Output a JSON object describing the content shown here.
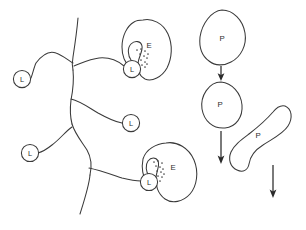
{
  "figure": {
    "background_color": "#ffffff",
    "line_color": "#3a3a3a",
    "arrow_color": "#2b2b2b",
    "label_color": "#2e2e2e",
    "width": 306,
    "height": 230
  },
  "network": {
    "name": "branching-filament-network",
    "trunk_segments": [
      {
        "id": "trunk-upper",
        "path": "M 78 18 C 77 30, 75 44, 73 57 C 72 62, 72 66, 73 70"
      },
      {
        "id": "trunk-middle",
        "path": "M 73 70 C 74 80, 73 90, 71 100 C 70 108, 70 116, 72 124"
      },
      {
        "id": "trunk-lower",
        "path": "M 72 124 C 75 134, 82 142, 87 150 C 91 157, 92 166, 90 175"
      },
      {
        "id": "trunk-tail",
        "path": "M 90 175 C 89 186, 85 198, 80 214"
      }
    ],
    "branches": [
      {
        "id": "branch-upper-left",
        "path": "M 73 63 C 68 60, 62 55, 56 53 C 48 50, 42 55, 36 63 C 34 67, 33 73, 31 78"
      },
      {
        "id": "branch-upper-right",
        "path": "M 74 66 C 82 63, 90 59, 99 58 C 110 57, 118 61, 124 66"
      },
      {
        "id": "branch-middle-right",
        "path": "M 71 99 C 80 101, 88 107, 98 113 C 107 118, 115 122, 122 123"
      },
      {
        "id": "branch-lower-left",
        "path": "M 72 127 C 66 131, 60 139, 52 145 C 47 149, 42 152, 38 153"
      },
      {
        "id": "branch-lower-right",
        "path": "M 89 168 C 99 170, 110 174, 122 178 C 130 180, 136 181, 141 181"
      }
    ]
  },
  "nodes": [
    {
      "id": "node-l-upper-left",
      "label": "L",
      "cx": 22,
      "cy": 79,
      "r": 8.6
    },
    {
      "id": "node-l-upper-right",
      "label": "L",
      "cx": 132,
      "cy": 69,
      "r": 8.6
    },
    {
      "id": "node-l-middle",
      "label": "L",
      "cx": 131,
      "cy": 123,
      "r": 8.6
    },
    {
      "id": "node-l-lower-left",
      "label": "L",
      "cx": 30,
      "cy": 153,
      "r": 8.6
    },
    {
      "id": "node-l-lower-right",
      "label": "L",
      "cx": 149,
      "cy": 182,
      "r": 8.6
    }
  ],
  "enzyme_bodies": [
    {
      "id": "enzyme-upper",
      "label": "E",
      "label_x": 149,
      "label_y": 45,
      "path": "M 143 20 C 152 18, 163 23, 168 34 C 173 45, 172 58, 167 68 C 162 77, 152 82, 145 79 C 139 76, 137 69, 138 63 C 139 56, 143 51, 142 46 C 141 41, 135 40, 131 44 C 127 48, 128 56, 131 60 C 133 63, 132 66, 129 65 C 125 63, 122 56, 122 47 C 122 36, 127 26, 134 22 C 137 20, 140 20, 143 20 Z"
    },
    {
      "id": "enzyme-lower",
      "label": "E",
      "label_x": 173,
      "label_y": 167,
      "path": "M 166 143 C 177 141, 189 148, 194 160 C 199 172, 197 186, 190 194 C 183 202, 172 204, 165 199 C 158 194, 155 185, 156 177 C 157 170, 160 165, 158 161 C 156 157, 151 157, 148 161 C 145 165, 146 172, 149 176 C 151 179, 150 182, 147 180 C 143 177, 141 169, 143 159 C 146 149, 156 144, 166 143 Z"
    }
  ],
  "interaction_dots": [
    {
      "id": "dots-upper",
      "cx": 141,
      "cy": 59,
      "points": [
        [
          -4,
          -9
        ],
        [
          0,
          -10
        ],
        [
          4,
          -8
        ],
        [
          7,
          -5
        ],
        [
          -1,
          -5
        ],
        [
          3,
          -3
        ],
        [
          6,
          -1
        ],
        [
          0,
          1
        ],
        [
          4,
          3
        ],
        [
          6,
          5
        ],
        [
          1,
          6
        ],
        [
          4,
          8
        ]
      ]
    },
    {
      "id": "dots-lower",
      "cx": 158,
      "cy": 172,
      "points": [
        [
          -4,
          -10
        ],
        [
          0,
          -11
        ],
        [
          4,
          -9
        ],
        [
          -2,
          -6
        ],
        [
          2,
          -5
        ],
        [
          5,
          -3
        ],
        [
          -1,
          -1
        ],
        [
          3,
          0
        ],
        [
          6,
          2
        ],
        [
          0,
          4
        ],
        [
          4,
          5
        ],
        [
          2,
          9
        ]
      ]
    }
  ],
  "particle_bodies": [
    {
      "id": "particle-top",
      "label": "P",
      "label_x": 222,
      "label_y": 38,
      "path": "M 222 10 C 233 10, 243 20, 245 33 C 247 45, 241 57, 231 62 C 224 66, 215 66, 209 61 C 202 56, 199 47, 200 37 C 202 24, 211 11, 222 10 Z"
    },
    {
      "id": "particle-middle",
      "label": "P",
      "label_x": 220,
      "label_y": 104,
      "path": "M 221 82 C 232 83, 241 93, 242 105 C 243 117, 236 127, 225 128 C 213 129, 204 121, 202 109 C 200 96, 209 82, 221 82 Z"
    },
    {
      "id": "particle-bottom",
      "label": "P",
      "label_x": 258,
      "label_y": 135,
      "path": "M 285 106 C 292 109, 293 118, 288 126 C 283 134, 272 139, 263 145 C 255 150, 250 157, 249 164 C 248 170, 243 173, 237 170 C 230 167, 228 159, 231 152 C 234 145, 241 140, 249 134 C 258 127, 267 119, 273 112 C 277 107, 281 105, 285 106 Z"
    }
  ],
  "arrows": [
    {
      "id": "arrow-top",
      "x1": 221,
      "y1": 66,
      "x2": 221,
      "y2": 80
    },
    {
      "id": "arrow-middle",
      "x1": 221,
      "y1": 131,
      "x2": 221,
      "y2": 163
    },
    {
      "id": "arrow-bottom",
      "x1": 273,
      "y1": 165,
      "x2": 273,
      "y2": 197
    }
  ]
}
